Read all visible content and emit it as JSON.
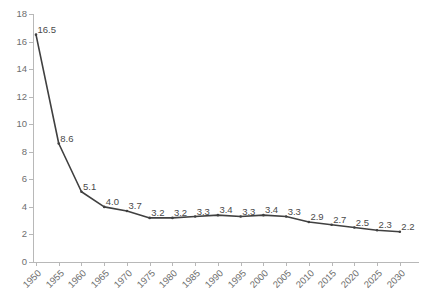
{
  "chart_data": {
    "type": "line",
    "title": "",
    "subtitle": "",
    "xlabel": "",
    "ylabel": "",
    "categories": [
      "1950",
      "1955",
      "1960",
      "1965",
      "1970",
      "1975",
      "1980",
      "1985",
      "1990",
      "1995",
      "2000",
      "2005",
      "2010",
      "2015",
      "2020",
      "2025",
      "2030"
    ],
    "values": [
      16.5,
      8.6,
      5.1,
      4.0,
      3.7,
      3.2,
      3.2,
      3.3,
      3.4,
      3.3,
      3.4,
      3.3,
      2.9,
      2.7,
      2.5,
      2.3,
      2.2
    ],
    "data_labels": [
      "16.5",
      "8.6",
      "5.1",
      "4.0",
      "3.7",
      "3.2",
      "3.2",
      "3.3",
      "3.4",
      "3.3",
      "3.4",
      "3.3",
      "2.9",
      "2.7",
      "2.5",
      "2.3",
      "2.2"
    ],
    "ylim": [
      0,
      18
    ],
    "yticks": [
      0,
      2,
      4,
      6,
      8,
      10,
      12,
      14,
      16,
      18
    ],
    "ytick_labels": [
      "0",
      "2",
      "4",
      "6",
      "8",
      "10",
      "12",
      "14",
      "16",
      "18"
    ],
    "grid": false,
    "legend": false,
    "legend_position": "none",
    "series": [
      {
        "name": "",
        "values": [
          16.5,
          8.6,
          5.1,
          4.0,
          3.7,
          3.2,
          3.2,
          3.3,
          3.4,
          3.3,
          3.4,
          3.3,
          2.9,
          2.7,
          2.5,
          2.3,
          2.2
        ]
      }
    ],
    "colors": {
      "line": "#404040",
      "marker": "#404040",
      "axis": "#b8b8b8",
      "tick_text": "#6e6e6e",
      "data_label_text": "#4a4a4a",
      "background": "#ffffff"
    }
  }
}
